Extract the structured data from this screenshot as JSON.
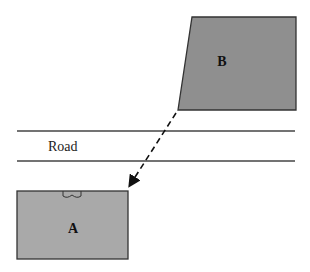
{
  "diagram": {
    "shapes": [
      {
        "id": "B",
        "label": "B",
        "kind": "quadrilateral",
        "fill": "#8f8f8f"
      },
      {
        "id": "A",
        "label": "A",
        "kind": "rectangle",
        "fill": "#a9a9a9"
      }
    ],
    "road": {
      "label": "Road",
      "line_color": "#444444"
    },
    "arrow": {
      "from": "B",
      "to": "A",
      "style": "dashed"
    }
  }
}
